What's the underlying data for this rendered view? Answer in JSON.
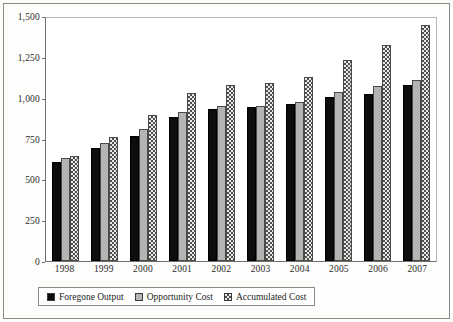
{
  "chart_data": {
    "type": "bar",
    "title": "",
    "xlabel": "",
    "ylabel": "",
    "ylim": [
      0,
      1500
    ],
    "yticks": [
      0,
      250,
      500,
      750,
      1000,
      1250,
      1500
    ],
    "ytick_labels": [
      "0",
      "250",
      "500",
      "750",
      "1,000",
      "1,250",
      "1,500"
    ],
    "grid": false,
    "legend_position": "bottom",
    "categories": [
      "1998",
      "1999",
      "2000",
      "2001",
      "2002",
      "2003",
      "2004",
      "2005",
      "2006",
      "2007"
    ],
    "series": [
      {
        "name": "Foregone Output",
        "color": "#0d0d0d",
        "pattern": "solid-black",
        "values": [
          612,
          697,
          770,
          888,
          937,
          950,
          967,
          1013,
          1031,
          1085
        ]
      },
      {
        "name": "Opportunity Cost",
        "color": "#b4b4b2",
        "pattern": "solid-gray",
        "values": [
          637,
          731,
          812,
          918,
          955,
          957,
          980,
          1044,
          1078,
          1120
        ]
      },
      {
        "name": "Accumulated Cost",
        "color": "#e9e9e7",
        "pattern": "cross-hatch",
        "values": [
          647,
          768,
          900,
          1035,
          1088,
          1100,
          1138,
          1241,
          1335,
          1457
        ]
      }
    ]
  },
  "legend": {
    "items": [
      {
        "label": "Foregone Output"
      },
      {
        "label": "Opportunity Cost"
      },
      {
        "label": "Accumulated Cost"
      }
    ]
  }
}
